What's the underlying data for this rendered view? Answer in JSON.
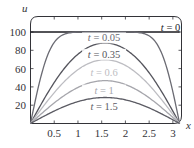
{
  "chart_data": {
    "type": "line",
    "title": "",
    "xlabel": "x",
    "ylabel": "u",
    "xlim": [
      0,
      3.14159
    ],
    "ylim": [
      0,
      110
    ],
    "grid": false,
    "legend": "inline labels",
    "x_ticks": [
      0.5,
      1,
      1.5,
      2,
      2.5,
      3
    ],
    "x_tick_labels": [
      "0.5",
      "1",
      "1.5",
      "2",
      "2.5",
      "3"
    ],
    "y_ticks": [
      20,
      40,
      60,
      80,
      100
    ],
    "y_tick_labels": [
      "20",
      "40",
      "60",
      "80",
      "100"
    ],
    "x": [
      0,
      0.1571,
      0.3142,
      0.4712,
      0.6283,
      0.7854,
      0.9425,
      1.0996,
      1.2566,
      1.4137,
      1.5708,
      1.7279,
      1.885,
      2.042,
      2.1991,
      2.3562,
      2.5133,
      2.6704,
      2.8274,
      2.9845,
      3.1416
    ],
    "series": [
      {
        "name": "t = 0",
        "t": 0,
        "color": "#1a1a1f",
        "label": "t = 0",
        "values": [
          100,
          100,
          100,
          100,
          100,
          100,
          100,
          100,
          100,
          100,
          100,
          100,
          100,
          100,
          100,
          100,
          100,
          100,
          100,
          100,
          100
        ]
      },
      {
        "name": "t = 0.05",
        "t": 0.05,
        "color": "#6b6b73",
        "label": "t = 0.05",
        "values": [
          0,
          38.1,
          68.4,
          87.0,
          95.8,
          98.9,
          99.7,
          99.9,
          99.9,
          99.9,
          99.9,
          99.9,
          99.9,
          99.9,
          99.7,
          98.9,
          95.8,
          87.0,
          68.4,
          38.1,
          0
        ]
      },
      {
        "name": "t = 0.35",
        "t": 0.35,
        "color": "#55555d",
        "label": "t = 0.35",
        "values": [
          0,
          20.2,
          38.4,
          53.7,
          65.7,
          74.6,
          80.7,
          84.6,
          86.8,
          87.9,
          88.2,
          87.9,
          86.8,
          84.6,
          80.7,
          74.6,
          65.7,
          53.7,
          38.4,
          20.2,
          0
        ]
      },
      {
        "name": "t = 0.6",
        "t": 0.6,
        "color": "#bdbdc2",
        "label": "t = 0.6",
        "values": [
          0,
          11.4,
          22.2,
          32.0,
          40.8,
          48.4,
          54.8,
          59.9,
          63.8,
          66.5,
          67.5,
          66.5,
          63.8,
          59.9,
          54.8,
          48.4,
          40.8,
          32.0,
          22.2,
          11.4,
          0
        ]
      },
      {
        "name": "t = 1",
        "t": 1,
        "color": "#a6a6ac",
        "label": "t = 1",
        "values": [
          0,
          7.3,
          14.4,
          21.2,
          27.4,
          33.0,
          37.9,
          41.9,
          44.5,
          46.2,
          46.8,
          46.2,
          44.5,
          41.9,
          37.9,
          33.0,
          27.4,
          21.2,
          14.4,
          7.3,
          0
        ]
      },
      {
        "name": "t = 1.5",
        "t": 1.5,
        "color": "#5c5c64",
        "label": "t = 1.5",
        "values": [
          0,
          4.4,
          8.8,
          12.9,
          16.7,
          20.1,
          23.0,
          25.3,
          27.0,
          28.1,
          28.4,
          28.1,
          27.0,
          25.3,
          23.0,
          20.1,
          16.7,
          12.9,
          8.8,
          4.4,
          0
        ]
      }
    ],
    "annotations": [
      {
        "text": "t = 0",
        "x": 2.95,
        "y": 104
      },
      {
        "text": "t = 0.05",
        "x": 1.55,
        "y": 93
      },
      {
        "text": "t = 0.35",
        "x": 1.55,
        "y": 75
      },
      {
        "text": "t = 0.6",
        "x": 1.55,
        "y": 55
      },
      {
        "text": "t = 1",
        "x": 1.55,
        "y": 36
      },
      {
        "text": "t = 1.5",
        "x": 1.55,
        "y": 18
      }
    ]
  },
  "axes": {
    "x_var": "x",
    "y_var": "u",
    "axis_color": "#333338"
  }
}
